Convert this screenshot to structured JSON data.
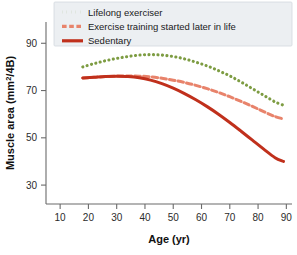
{
  "chart_data": {
    "type": "line",
    "title": "",
    "xlabel": "Age (yr)",
    "ylabel": "Muscle area (mm²/4B)",
    "xlim": [
      5,
      92
    ],
    "ylim": [
      22,
      99
    ],
    "xticks": [
      10,
      20,
      30,
      40,
      50,
      60,
      70,
      80,
      90
    ],
    "yticks": [
      30,
      50,
      70,
      90
    ],
    "xtick_labels": [
      "10",
      "20",
      "30",
      "40",
      "50",
      "60",
      "70",
      "80",
      "90"
    ],
    "ytick_labels": [
      "30",
      "50",
      "70",
      "90"
    ],
    "grid": false,
    "legend_position": "top-right",
    "series": [
      {
        "name": "Lifelong exerciser",
        "color": "#7d9c42",
        "style": "dotted",
        "x": [
          18,
          22,
          26,
          30,
          34,
          38,
          42,
          46,
          50,
          54,
          58,
          62,
          66,
          70,
          74,
          78,
          82,
          86,
          89
        ],
        "y": [
          80.0,
          81.4,
          82.6,
          83.6,
          84.4,
          85.0,
          85.2,
          85.0,
          84.4,
          83.4,
          82.0,
          80.4,
          78.4,
          76.2,
          73.6,
          70.8,
          68.0,
          65.2,
          63.8
        ]
      },
      {
        "name": "Exercise training started later in life",
        "color": "#e8836b",
        "style": "dashed",
        "x": [
          18,
          22,
          26,
          30,
          34,
          38,
          42,
          46,
          50,
          54,
          58,
          62,
          66,
          70,
          74,
          78,
          82,
          86,
          89
        ],
        "y": [
          75.3,
          75.6,
          75.9,
          76.1,
          76.2,
          76.1,
          75.8,
          75.2,
          74.4,
          73.4,
          72.2,
          70.8,
          69.2,
          67.4,
          65.4,
          63.3,
          61.1,
          59.0,
          58.0
        ]
      },
      {
        "name": "Sedentary",
        "color": "#c0301c",
        "style": "solid",
        "x": [
          18,
          22,
          26,
          30,
          34,
          38,
          42,
          46,
          50,
          54,
          58,
          62,
          66,
          70,
          74,
          78,
          82,
          86,
          89
        ],
        "y": [
          75.3,
          75.6,
          75.9,
          76.0,
          75.9,
          75.4,
          74.4,
          72.9,
          71.0,
          68.7,
          66.1,
          63.2,
          60.0,
          56.5,
          52.8,
          49.0,
          45.2,
          41.6,
          40.0
        ]
      }
    ]
  },
  "legend": {
    "items": [
      {
        "label": "Lifelong exerciser",
        "color": "#7d9c42",
        "style": "dotted"
      },
      {
        "label": "Exercise training started later in life",
        "color": "#e8836b",
        "style": "dashed"
      },
      {
        "label": "Sedentary",
        "color": "#c0301c",
        "style": "solid"
      }
    ]
  },
  "axes": {
    "x_title": "Age (yr)",
    "y_title": "Muscle area (mm²/4B)"
  }
}
